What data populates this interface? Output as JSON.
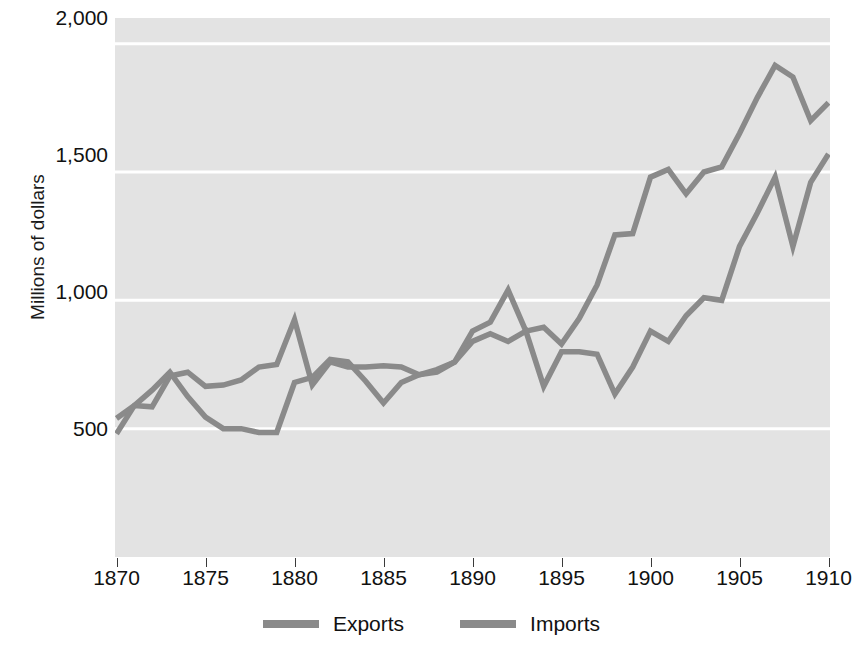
{
  "chart_data": {
    "type": "line",
    "title": "",
    "xlabel": "",
    "ylabel": "Millions of dollars",
    "xlim": [
      1870,
      1910
    ],
    "ylim": [
      0,
      2100
    ],
    "grid": true,
    "grid_color": "#ffffff",
    "plot_background": "#e3e3e3",
    "legend_position": "bottom-center",
    "ytick_labels": [
      "500",
      "1,000",
      "1,500",
      "2,000"
    ],
    "ytick_values": [
      500,
      1000,
      1500,
      2000
    ],
    "xtick_labels": [
      "1870",
      "1875",
      "1880",
      "1885",
      "1890",
      "1895",
      "1900",
      "1905",
      "1910"
    ],
    "xtick_values": [
      1870,
      1875,
      1880,
      1885,
      1890,
      1895,
      1900,
      1905,
      1910
    ],
    "x": [
      1870,
      1871,
      1872,
      1873,
      1874,
      1875,
      1876,
      1877,
      1878,
      1879,
      1880,
      1881,
      1882,
      1883,
      1884,
      1885,
      1886,
      1887,
      1888,
      1889,
      1890,
      1891,
      1892,
      1893,
      1894,
      1895,
      1896,
      1897,
      1898,
      1899,
      1900,
      1901,
      1902,
      1903,
      1904,
      1905,
      1906,
      1907,
      1908,
      1909,
      1910
    ],
    "series": [
      {
        "name": "Exports",
        "color": "#8a8a8a",
        "values": [
          540,
          590,
          585,
          705,
          720,
          665,
          670,
          690,
          740,
          750,
          925,
          670,
          760,
          740,
          740,
          745,
          740,
          710,
          720,
          760,
          880,
          915,
          1040,
          880,
          895,
          830,
          930,
          1060,
          1255,
          1260,
          1480,
          1510,
          1415,
          1500,
          1520,
          1650,
          1790,
          1915,
          1870,
          1700,
          1770
        ]
      },
      {
        "name": "Imports",
        "color": "#8a8a8a",
        "values": [
          480,
          590,
          650,
          720,
          625,
          545,
          500,
          500,
          485,
          485,
          680,
          700,
          770,
          760,
          685,
          600,
          680,
          710,
          730,
          760,
          840,
          870,
          840,
          880,
          665,
          800,
          800,
          790,
          635,
          740,
          880,
          840,
          940,
          1010,
          1000,
          1210,
          1340,
          1480,
          1210,
          1460,
          1570
        ]
      }
    ]
  },
  "legend": {
    "items": [
      {
        "label": "Exports",
        "swatch_color": "#8a8a8a"
      },
      {
        "label": "Imports",
        "swatch_color": "#8a8a8a"
      }
    ]
  }
}
